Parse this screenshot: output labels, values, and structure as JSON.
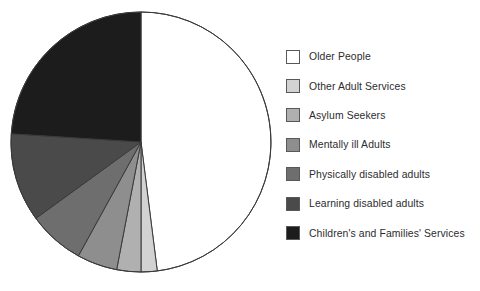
{
  "chart_data": {
    "type": "pie",
    "title": "",
    "subtitle": "",
    "xlabel": "",
    "ylabel": "",
    "grid": false,
    "legend_position": "right",
    "start_angle_deg": 0,
    "direction": "clockwise",
    "categories": [
      "Older People",
      "Other Adult Services",
      "Asylum Seekers",
      "Mentally ill Adults",
      "Physically disabled adults",
      "Learning disabled adults",
      "Children's and Families' Services"
    ],
    "values": [
      48,
      2,
      3,
      5,
      7,
      11,
      24
    ],
    "unit": "percent",
    "colors": [
      "#ffffff",
      "#d2d2d2",
      "#b0b0b0",
      "#8e8e8e",
      "#6e6e6e",
      "#4a4a4a",
      "#1c1c1c"
    ],
    "slice_border_color": "#3a3a3c",
    "geometry": {
      "center_x": 141,
      "center_y": 142,
      "radius": 130
    }
  },
  "legend": {
    "items": [
      {
        "label": "Older People",
        "color": "#ffffff"
      },
      {
        "label": "Other Adult Services",
        "color": "#d2d2d2"
      },
      {
        "label": "Asylum Seekers",
        "color": "#b0b0b0"
      },
      {
        "label": "Mentally ill Adults",
        "color": "#8e8e8e"
      },
      {
        "label": "Physically disabled adults",
        "color": "#6e6e6e"
      },
      {
        "label": "Learning disabled adults",
        "color": "#4a4a4a"
      },
      {
        "label": "Children's and Families' Services",
        "color": "#1c1c1c"
      }
    ]
  }
}
